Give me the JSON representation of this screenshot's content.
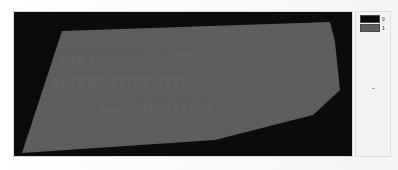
{
  "figure": {
    "kind": "binary-segmentation-mask",
    "width": 398,
    "height": 170
  },
  "mask_panel": {
    "name": "mask-raster",
    "background_color": "#090909",
    "region_color": "#5d5d5d",
    "ghost_text": {
      "line_1": "THE LOCATION AND",
      "line_2": "ALTERNATIVE SITE",
      "line_3": "DOCUMENTATION"
    }
  },
  "chart_data": {
    "type": "heatmap",
    "title": "",
    "xlabel": "",
    "ylabel": "",
    "grid": false,
    "legend_position": "right",
    "colormap": "binary",
    "value_levels": [
      0,
      1
    ],
    "level_colors": [
      "#0a0a0a",
      "#5d5d5d"
    ],
    "level_labels": [
      "0",
      "1"
    ],
    "xlim": [
      0,
      338
    ],
    "ylim": [
      0,
      144
    ],
    "region_polygon": [
      [
        48,
        19
      ],
      [
        316,
        10
      ],
      [
        321,
        30
      ],
      [
        326,
        78
      ],
      [
        299,
        103
      ],
      [
        201,
        128
      ],
      [
        8,
        141
      ]
    ]
  },
  "legend": {
    "name": "mask-value-legend",
    "entries": [
      {
        "label": "0",
        "color": "#0a0a0a"
      },
      {
        "label": "1",
        "color": "#5d5d5d"
      }
    ]
  }
}
